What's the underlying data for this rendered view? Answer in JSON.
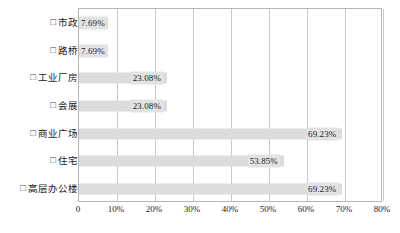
{
  "chart_data": {
    "type": "bar",
    "orientation": "horizontal",
    "title": "",
    "xlabel": "",
    "ylabel": "",
    "xlim": [
      0,
      80
    ],
    "grid": true,
    "legend_position": "none",
    "marker_glyph": "□",
    "categories": [
      "市政",
      "路桥",
      "工业厂房",
      "会展",
      "商业广场",
      "住宅",
      "高层办公楼"
    ],
    "values": [
      7.69,
      7.69,
      23.08,
      23.08,
      69.23,
      53.85,
      69.23
    ],
    "value_labels": [
      "7.69%",
      "7.69%",
      "23.08%",
      "23.08%",
      "69.23%",
      "53.85%",
      "69.23%"
    ],
    "xticks": [
      0,
      10,
      20,
      30,
      40,
      50,
      60,
      70,
      80
    ],
    "xtick_labels": [
      "0",
      "10%",
      "20%",
      "30%",
      "40%",
      "50%",
      "60%",
      "70%",
      "80%"
    ],
    "colors": {
      "bar_fill": "#dcdcdc",
      "label_background": "#e2e2e2",
      "gridline": "#c9c9c9",
      "plot_border": "#b6b6b6",
      "text": "#1a1a1a",
      "background": "#ffffff"
    }
  }
}
